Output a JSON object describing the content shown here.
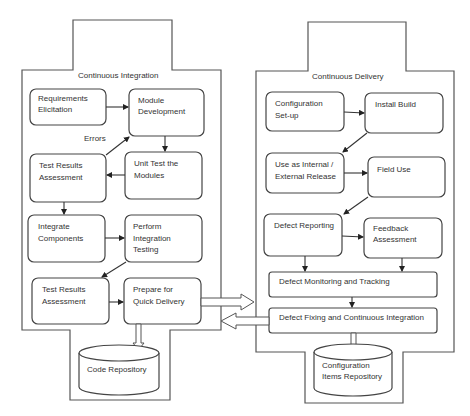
{
  "diagram": {
    "continuous_integration": {
      "title": "Continuous Integration",
      "nodes": {
        "requirements": [
          "Requirements",
          "Elicitation"
        ],
        "module_dev": [
          "Module",
          "Development"
        ],
        "errors_label": "Errors",
        "test_results_1": [
          "Test Results",
          "Assessment"
        ],
        "unit_test": [
          "Unit Test the",
          "Modules"
        ],
        "integrate": [
          "Integrate",
          "Components"
        ],
        "perform_integration": [
          "Perform",
          "Integration",
          "Testing"
        ],
        "test_results_2": [
          "Test Results",
          "Assessment"
        ],
        "prepare": [
          "Prepare for",
          "Quick Delivery"
        ]
      },
      "repository": "Code Repository"
    },
    "continuous_delivery": {
      "title": "Continuous Delivery",
      "nodes": {
        "config_setup": [
          "Configuration",
          "Set-up"
        ],
        "install_build": [
          "Install Build"
        ],
        "use_release": [
          "Use as Internal /",
          "External  Release"
        ],
        "field_use": [
          "Field Use"
        ],
        "defect_reporting": [
          "Defect Reporting"
        ],
        "feedback": [
          "Feedback",
          "Assessment"
        ],
        "monitoring": "Defect Monitoring and Tracking",
        "fixing": "Defect Fixing and Continuous Integration"
      },
      "repository": [
        "Configuration",
        "Items Repository"
      ]
    }
  }
}
